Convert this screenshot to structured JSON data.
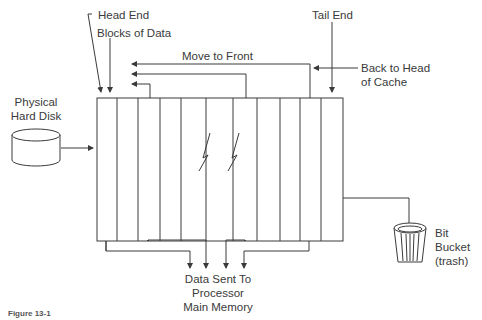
{
  "diagram": {
    "labels": {
      "head_end": "Head End",
      "blocks_of_data": "Blocks of Data",
      "move_to_front": "Move to Front",
      "tail_end": "Tail End",
      "back_to_head_line1": "Back to Head",
      "back_to_head_line2": "of Cache",
      "physical_line1": "Physical",
      "physical_line2": "Hard Disk",
      "data_sent_line1": "Data Sent To",
      "data_sent_line2": "Processor",
      "data_sent_line3": "Main Memory",
      "bit_line1": "Bit",
      "bit_line2": "Bucket",
      "bit_line3": "(trash)"
    },
    "caption": "Figure 13-1",
    "nodes": [
      "Physical Hard Disk",
      "Cache Blocks of Data",
      "Processor Main Memory",
      "Bit Bucket (trash)"
    ],
    "colors": {
      "line": "#3a3a3a",
      "background": "#ffffff"
    }
  }
}
